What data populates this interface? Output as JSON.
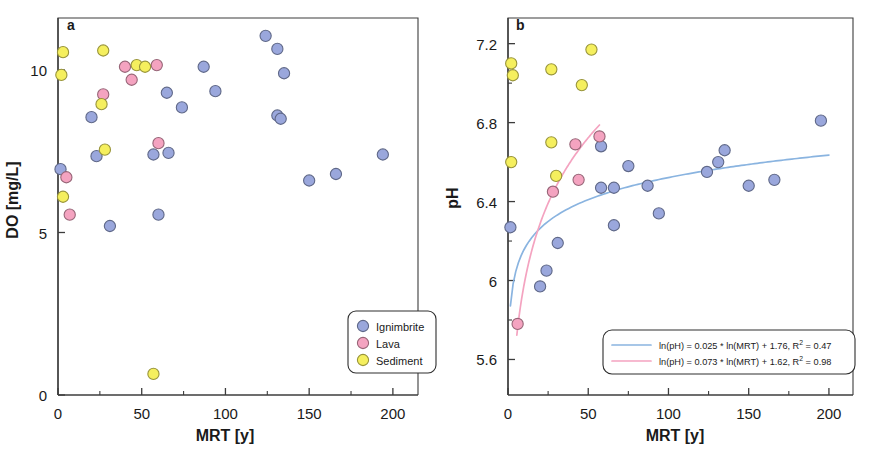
{
  "figure": {
    "panels": [
      {
        "letter": "a",
        "xlabel": "MRT [y]",
        "ylabel": "DO [mg/L]"
      },
      {
        "letter": "b",
        "xlabel": "MRT [y]",
        "ylabel": "pH"
      }
    ]
  },
  "legend_a": {
    "items": [
      {
        "label": "Ignimbrite",
        "color": "#9aa7dc"
      },
      {
        "label": "Lava",
        "color": "#f4a3c0"
      },
      {
        "label": "Sediment",
        "color": "#f5ef5e"
      }
    ]
  },
  "legend_b": {
    "items": [
      {
        "text": "ln(pH) = 0.025 * ln(MRT) + 1.76,  R",
        "sup": "2",
        "tail": " = 0.47",
        "color": "#8ab4e0"
      },
      {
        "text": "ln(pH) = 0.073 * ln(MRT) + 1.62,  R",
        "sup": "2",
        "tail": " = 0.98",
        "color": "#f4a3c0"
      }
    ]
  },
  "chart_data": [
    {
      "type": "scatter",
      "panel": "a",
      "title": "",
      "xlabel": "MRT [y]",
      "ylabel": "DO [mg/L]",
      "xlim": [
        0,
        215
      ],
      "ylim": [
        0,
        11.6
      ],
      "xticks": [
        0,
        50,
        100,
        150,
        200
      ],
      "xticks_minor": [
        25,
        75,
        125,
        175
      ],
      "yticks": [
        0,
        5,
        10
      ],
      "grid": false,
      "legend_position": "bottom-right",
      "series": [
        {
          "name": "Ignimbrite",
          "color": "#9aa7dc",
          "points": [
            [
              1.5,
              6.95
            ],
            [
              20,
              8.55
            ],
            [
              23,
              7.35
            ],
            [
              31,
              5.2
            ],
            [
              57,
              7.4
            ],
            [
              60,
              5.55
            ],
            [
              66,
              7.45
            ],
            [
              65,
              9.3
            ],
            [
              74,
              8.85
            ],
            [
              87,
              10.1
            ],
            [
              94,
              9.35
            ],
            [
              124,
              11.05
            ],
            [
              131,
              10.65
            ],
            [
              131,
              8.6
            ],
            [
              133,
              8.5
            ],
            [
              135,
              9.9
            ],
            [
              150,
              6.6
            ],
            [
              166,
              6.8
            ],
            [
              194,
              7.4
            ]
          ]
        },
        {
          "name": "Lava",
          "color": "#f4a3c0",
          "points": [
            [
              5,
              6.7
            ],
            [
              7,
              5.55
            ],
            [
              40,
              10.1
            ],
            [
              44,
              9.7
            ],
            [
              27,
              9.25
            ],
            [
              59,
              10.15
            ],
            [
              60,
              7.75
            ]
          ]
        },
        {
          "name": "Sediment",
          "color": "#f5ef5e",
          "points": [
            [
              3,
              10.55
            ],
            [
              2,
              9.85
            ],
            [
              3,
              6.1
            ],
            [
              27,
              10.6
            ],
            [
              26,
              8.95
            ],
            [
              28,
              7.55
            ],
            [
              47,
              10.15
            ],
            [
              52,
              10.1
            ],
            [
              57,
              0.65
            ]
          ]
        }
      ]
    },
    {
      "type": "scatter",
      "panel": "b",
      "title": "",
      "xlabel": "MRT [y]",
      "ylabel": "pH",
      "xlim": [
        0,
        215
      ],
      "ylim": [
        5.42,
        7.33
      ],
      "xticks": [
        0,
        50,
        100,
        150,
        200
      ],
      "xticks_minor": [
        25,
        75,
        125,
        175
      ],
      "yticks": [
        5.6,
        6,
        6.4,
        6.8,
        7.2
      ],
      "yticks_minor": [
        5.8,
        6.2,
        6.6,
        7.0
      ],
      "grid": false,
      "legend_position": "bottom-right",
      "series": [
        {
          "name": "Ignimbrite",
          "color": "#9aa7dc",
          "points": [
            [
              1.5,
              6.27
            ],
            [
              20,
              5.97
            ],
            [
              24,
              6.05
            ],
            [
              31,
              6.19
            ],
            [
              58,
              6.68
            ],
            [
              58,
              6.47
            ],
            [
              66,
              6.47
            ],
            [
              66,
              6.28
            ],
            [
              75,
              6.58
            ],
            [
              87,
              6.48
            ],
            [
              94,
              6.34
            ],
            [
              124,
              6.55
            ],
            [
              131,
              6.6
            ],
            [
              135,
              6.66
            ],
            [
              150,
              6.48
            ],
            [
              166,
              6.51
            ],
            [
              195,
              6.81
            ]
          ]
        },
        {
          "name": "Lava",
          "color": "#f4a3c0",
          "points": [
            [
              6,
              5.78
            ],
            [
              28,
              6.45
            ],
            [
              42,
              6.69
            ],
            [
              44,
              6.51
            ],
            [
              57,
              6.73
            ]
          ]
        },
        {
          "name": "Sediment",
          "color": "#f5ef5e",
          "points": [
            [
              2,
              7.1
            ],
            [
              3,
              7.04
            ],
            [
              2,
              6.6
            ],
            [
              27,
              7.07
            ],
            [
              27,
              6.7
            ],
            [
              30,
              6.53
            ],
            [
              46,
              6.99
            ],
            [
              52,
              7.17
            ]
          ]
        }
      ],
      "fits": [
        {
          "name": "Ignimbrite fit",
          "color": "#8ab4e0",
          "equation": "ln(pH) = 0.025 * ln(MRT) + 1.76",
          "slope": 0.025,
          "intercept": 1.76,
          "r2": 0.47,
          "x_range": [
            1.5,
            200
          ]
        },
        {
          "name": "Lava fit",
          "color": "#f4a3c0",
          "equation": "ln(pH) = 0.073 * ln(MRT) + 1.62",
          "slope": 0.073,
          "intercept": 1.62,
          "r2": 0.98,
          "x_range": [
            5.5,
            57
          ]
        }
      ]
    }
  ]
}
